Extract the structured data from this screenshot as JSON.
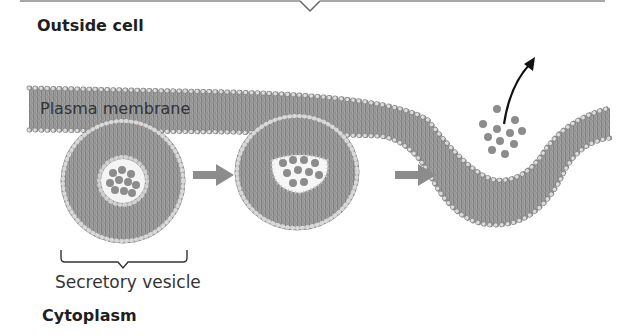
{
  "labels": {
    "outside": "Outside cell",
    "membrane": "Plasma membrane",
    "vesicle": "Secretory vesicle",
    "cytoplasm": "Cytoplasm"
  },
  "stages": [
    {
      "name": "vesicle-approach"
    },
    {
      "name": "vesicle-docking"
    },
    {
      "name": "exocytosis-release"
    }
  ],
  "colors": {
    "membrane_fill": "#9a9a9a",
    "membrane_dark": "#6e6e6e",
    "head_beads": "#cfcfcf",
    "cargo": "#8a8a8a",
    "arrow_gray": "#8c8c8c",
    "arrow_black": "#111111"
  }
}
